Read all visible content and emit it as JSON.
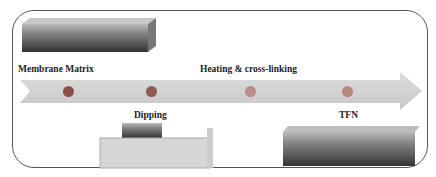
{
  "diagram": {
    "type": "process-flow",
    "steps": [
      {
        "label": "Membrane Matrix",
        "dot_color": "#8a4f4a"
      },
      {
        "label": "Dipping",
        "dot_color": "#8f5a52"
      },
      {
        "label": "Heating & cross-linking",
        "dot_color": "#b78f86"
      },
      {
        "label": "TFN",
        "dot_color": "#b3877a"
      }
    ],
    "arrow_color": "#d3d3d3",
    "images": [
      "membrane-matrix-image",
      "dipping-bath-image",
      "tfn-membrane-image"
    ]
  }
}
